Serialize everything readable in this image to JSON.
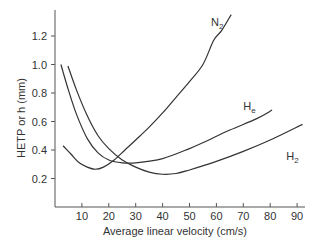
{
  "chart_data": {
    "type": "line",
    "title": "",
    "xlabel": "Average linear velocity (cm/s)",
    "ylabel": "HETP or h (mm)",
    "xlim": [
      0,
      92
    ],
    "ylim": [
      0,
      1.45
    ],
    "xticks": [
      10,
      20,
      30,
      40,
      50,
      60,
      70,
      80,
      90
    ],
    "yticks": [
      0.2,
      0.4,
      0.6,
      0.8,
      1.0,
      1.2
    ],
    "xtick_labels": [
      "10",
      "20",
      "30",
      "40",
      "50",
      "60",
      "70",
      "80",
      "90"
    ],
    "ytick_labels": [
      "0.2",
      "0.4",
      "0.6",
      "0.8",
      "1.0",
      "1.2"
    ],
    "grid": false,
    "legend": "inline labels",
    "series": [
      {
        "name": "N2",
        "label_main": "N",
        "label_sub": "2",
        "label_pos": [
          58,
          1.27
        ],
        "points": [
          [
            3,
            0.43
          ],
          [
            6,
            0.37
          ],
          [
            9,
            0.31
          ],
          [
            12,
            0.28
          ],
          [
            15,
            0.265
          ],
          [
            18,
            0.28
          ],
          [
            22,
            0.33
          ],
          [
            26,
            0.4
          ],
          [
            30,
            0.47
          ],
          [
            35,
            0.56
          ],
          [
            40,
            0.66
          ],
          [
            45,
            0.77
          ],
          [
            50,
            0.88
          ],
          [
            55,
            1.0
          ],
          [
            59,
            1.17
          ],
          [
            62,
            1.24
          ],
          [
            65.5,
            1.35
          ]
        ]
      },
      {
        "name": "He",
        "label_main": "H",
        "label_sub": "e",
        "label_pos": [
          70,
          0.68
        ],
        "points": [
          [
            2.2,
            1.0
          ],
          [
            5,
            0.82
          ],
          [
            8,
            0.65
          ],
          [
            12,
            0.48
          ],
          [
            16,
            0.38
          ],
          [
            20,
            0.33
          ],
          [
            25,
            0.31
          ],
          [
            30,
            0.31
          ],
          [
            40,
            0.34
          ],
          [
            50,
            0.41
          ],
          [
            56,
            0.46
          ],
          [
            65,
            0.54
          ],
          [
            75,
            0.62
          ],
          [
            80.7,
            0.68
          ]
        ]
      },
      {
        "name": "H2",
        "label_main": "H",
        "label_sub": "2",
        "label_pos": [
          86,
          0.33
        ],
        "points": [
          [
            4.8,
            0.99
          ],
          [
            8,
            0.82
          ],
          [
            12,
            0.64
          ],
          [
            16,
            0.5
          ],
          [
            20,
            0.41
          ],
          [
            25,
            0.33
          ],
          [
            30,
            0.28
          ],
          [
            35,
            0.245
          ],
          [
            40,
            0.23
          ],
          [
            45,
            0.235
          ],
          [
            50,
            0.26
          ],
          [
            60,
            0.32
          ],
          [
            70,
            0.39
          ],
          [
            80,
            0.47
          ],
          [
            92,
            0.58
          ]
        ]
      }
    ]
  }
}
